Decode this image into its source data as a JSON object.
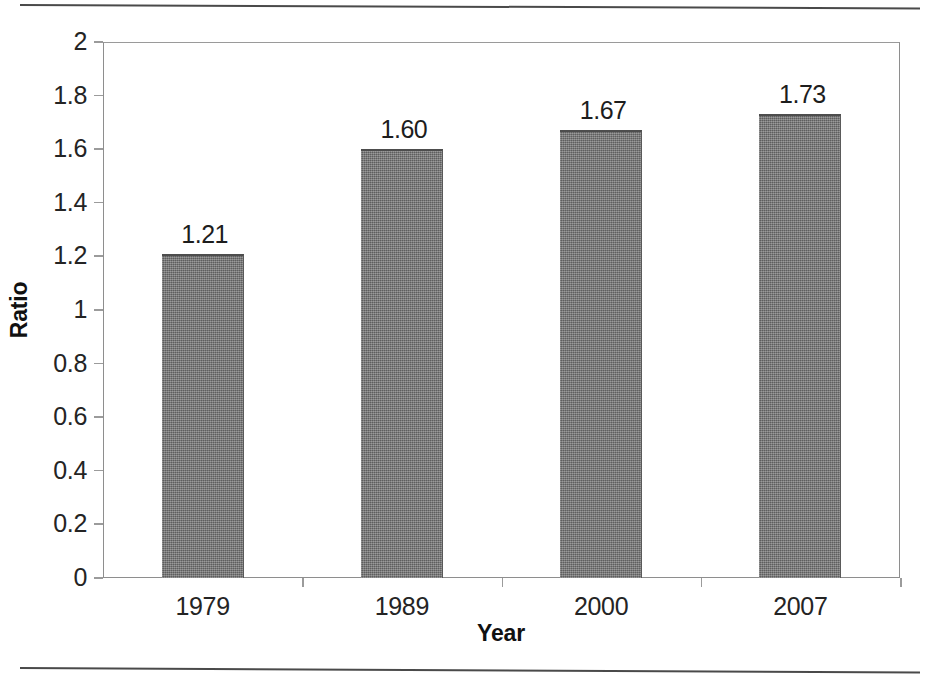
{
  "chart_data": {
    "type": "bar",
    "title": "",
    "xlabel": "Year",
    "ylabel": "Ratio",
    "categories": [
      "1979",
      "1989",
      "2000",
      "2007"
    ],
    "values": [
      1.21,
      1.6,
      1.67,
      1.73
    ],
    "value_labels": [
      "1.21",
      "1.60",
      "1.67",
      "1.73"
    ],
    "ylim": [
      0,
      2
    ],
    "ytick_labels": [
      "2",
      "1.8",
      "1.6",
      "1.4",
      "1.2",
      "1",
      "0.8",
      "0.6",
      "0.4",
      "0.2",
      "0"
    ],
    "ytick_values": [
      2,
      1.8,
      1.6,
      1.4,
      1.2,
      1,
      0.8,
      0.6,
      0.4,
      0.2,
      0
    ],
    "grid": false,
    "legend": "none",
    "series": [
      {
        "name": "Ratio",
        "values": [
          1.21,
          1.6,
          1.67,
          1.73
        ],
        "color": "#737373"
      }
    ]
  },
  "colors": {
    "bar_fill": "#737373",
    "bar_edge": "#4d4d4d",
    "axis_line": "#8e8e8e",
    "text": "#1d1d1d",
    "page_rule": "#4a4a4a",
    "background": "#ffffff"
  }
}
